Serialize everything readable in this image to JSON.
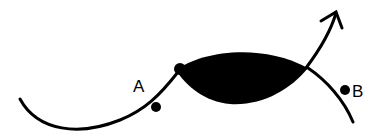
{
  "diagram": {
    "stroke_color": "#000000",
    "fill_color": "#000000",
    "background": "#ffffff",
    "labels": {
      "a": "A",
      "b": "B"
    },
    "elements": [
      {
        "name": "curve-left",
        "type": "curve"
      },
      {
        "name": "filled-lens",
        "type": "filled-region"
      },
      {
        "name": "curve-upper-arrow",
        "type": "arrow-curve"
      },
      {
        "name": "curve-lower-right",
        "type": "curve"
      },
      {
        "name": "point-a",
        "type": "dot",
        "label": "A"
      },
      {
        "name": "point-b",
        "type": "dot",
        "label": "B"
      }
    ]
  }
}
